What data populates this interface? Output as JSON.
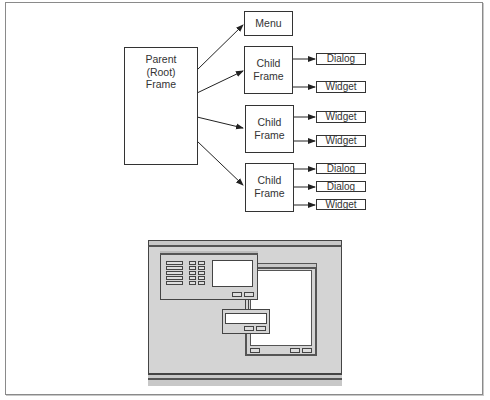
{
  "diagram": {
    "parent": {
      "lines": [
        "Parent",
        "(Root)",
        "Frame"
      ]
    },
    "menu": {
      "label": "Menu"
    },
    "child_frames": [
      {
        "lines": [
          "Child",
          "Frame"
        ],
        "children": [
          "Dialog",
          "Widget"
        ]
      },
      {
        "lines": [
          "Child",
          "Frame"
        ],
        "children": [
          "Widget",
          "Widget"
        ]
      },
      {
        "lines": [
          "Child",
          "Frame"
        ],
        "children": [
          "Dialog",
          "Dialog",
          "Widget"
        ]
      }
    ]
  },
  "illustration": {
    "description": "schematic of a screen with a main window, a secondary window and a dialog",
    "colors": {
      "screen_bg": "#d4d4d4",
      "outline": "#444444",
      "window_bg": "#ffffff"
    }
  }
}
